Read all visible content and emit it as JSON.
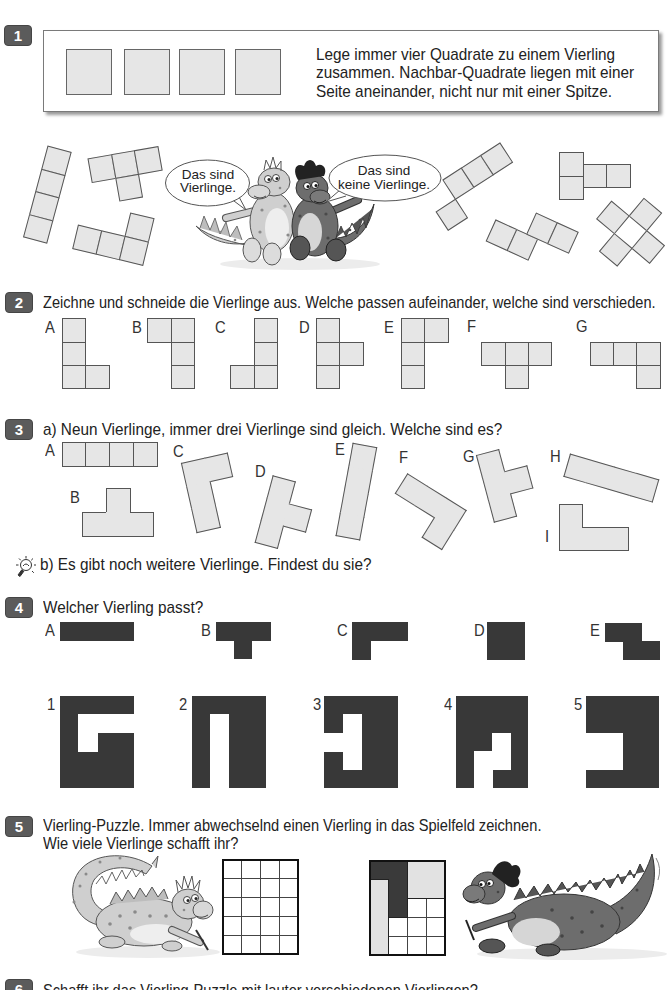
{
  "colors": {
    "badge": "#5b5b5b",
    "tile_fill": "#e6e6e6",
    "tile_stroke": "#555555",
    "dark_fill": "#383838",
    "light_fill": "#e2e2e2"
  },
  "exercise1": {
    "number": "1",
    "instruction_lines": [
      "Lege immer vier Quadrate zu einem Vierling",
      "zusammen. Nachbar-Quadrate liegen mit einer",
      "Seite aneinander, nicht nur mit einer Spitze."
    ],
    "bubble_left": {
      "line1": "Das sind",
      "line2": "Vierlinge."
    },
    "bubble_right": {
      "line1": "Das sind",
      "line2": "keine Vierlinge."
    },
    "valid_examples": [
      {
        "name": "I",
        "cx": 46.5,
        "cy": 194,
        "rot": 15,
        "s": 23.5,
        "style": "grid",
        "cells": [
          [
            0,
            0
          ],
          [
            0,
            1
          ],
          [
            0,
            2
          ],
          [
            0,
            3
          ]
        ]
      },
      {
        "name": "T",
        "cx": 125.8,
        "cy": 175,
        "rot": -10,
        "s": 23.5,
        "style": "grid",
        "cells": [
          [
            0,
            0
          ],
          [
            1,
            0
          ],
          [
            2,
            0
          ],
          [
            1,
            1
          ]
        ]
      },
      {
        "name": "L",
        "cx": 112.7,
        "cy": 233.2,
        "rot": 13.5,
        "s": 24,
        "style": "grid",
        "cells": [
          [
            2,
            0
          ],
          [
            0,
            1
          ],
          [
            1,
            1
          ],
          [
            2,
            1
          ]
        ]
      }
    ],
    "invalid_examples": [
      {
        "name": "corner-touch",
        "cx": 473.6,
        "cy": 187.1,
        "rot": -33,
        "s": 22.7,
        "style": "grid",
        "cells": [
          [
            1,
            0
          ],
          [
            2,
            0
          ],
          [
            3,
            0
          ],
          [
            0,
            1
          ]
        ]
      },
      {
        "name": "half-offset",
        "x": 559,
        "y": 152,
        "rot": 0,
        "s": 23.5,
        "style": "grid",
        "cells": [
          [
            0,
            0
          ],
          [
            0,
            1
          ],
          [
            1,
            0.5
          ],
          [
            2,
            0.5
          ]
        ]
      },
      {
        "name": "shifted-dominoes",
        "cx": 532.1,
        "cy": 236,
        "rot": 24.5,
        "s": 22.9,
        "style": "grid",
        "cells": [
          [
            0,
            1
          ],
          [
            1,
            1
          ],
          [
            1.5,
            0
          ],
          [
            2.5,
            0
          ]
        ]
      },
      {
        "name": "ring",
        "cx": 630,
        "cy": 231,
        "rot": 40,
        "s": 23,
        "style": "grid",
        "cells": [
          [
            1,
            0
          ],
          [
            0,
            1
          ],
          [
            2,
            1
          ],
          [
            1,
            2
          ]
        ]
      }
    ]
  },
  "exercise2": {
    "number": "2",
    "instruction": "Zeichne und schneide die Vierlinge aus. Welche passen aufeinander, welche sind verschieden.",
    "shapes": [
      {
        "label": "A",
        "x": 61.9,
        "y": 318.3,
        "s": 23.4,
        "style": "grid",
        "cells": [
          [
            0,
            0
          ],
          [
            0,
            1
          ],
          [
            0,
            2
          ],
          [
            1,
            2
          ]
        ]
      },
      {
        "label": "B",
        "x": 147.2,
        "y": 318.3,
        "s": 23.4,
        "style": "grid",
        "cells": [
          [
            0,
            0
          ],
          [
            1,
            0
          ],
          [
            1,
            1
          ],
          [
            1,
            2
          ]
        ]
      },
      {
        "label": "C",
        "x": 230.4,
        "y": 318.3,
        "s": 23.4,
        "style": "grid",
        "cells": [
          [
            1,
            0
          ],
          [
            1,
            1
          ],
          [
            0,
            2
          ],
          [
            1,
            2
          ]
        ]
      },
      {
        "label": "D",
        "x": 315.8,
        "y": 318.3,
        "s": 23.4,
        "style": "grid",
        "cells": [
          [
            0,
            0
          ],
          [
            0,
            1
          ],
          [
            1,
            1
          ],
          [
            0,
            2
          ]
        ]
      },
      {
        "label": "E",
        "x": 401.1,
        "y": 318.3,
        "s": 23.4,
        "style": "grid",
        "cells": [
          [
            0,
            0
          ],
          [
            1,
            0
          ],
          [
            0,
            1
          ],
          [
            0,
            2
          ]
        ]
      },
      {
        "label": "F",
        "x": 481.3,
        "y": 318.3,
        "s": 23.4,
        "style": "grid",
        "cells": [
          [
            0,
            1
          ],
          [
            1,
            1
          ],
          [
            2,
            1
          ],
          [
            1,
            2
          ]
        ]
      },
      {
        "label": "G",
        "x": 589.7,
        "y": 318.3,
        "s": 23.4,
        "style": "grid",
        "cells": [
          [
            0,
            1
          ],
          [
            1,
            1
          ],
          [
            2,
            1
          ],
          [
            2,
            2
          ]
        ]
      }
    ]
  },
  "exercise3": {
    "number": "3",
    "part_a": "a) Neun Vierlinge, immer drei Vierlinge sind gleich. Welche sind es?",
    "part_b": "b) Es gibt noch weitere Vierlinge. Findest du sie?",
    "hint_icon": "lightbulb-icon",
    "shapes": [
      {
        "label": "A",
        "x": 61.7,
        "y": 442.3,
        "s": 23.75,
        "style": "grid",
        "cells": [
          [
            0,
            0
          ],
          [
            1,
            0
          ],
          [
            2,
            0
          ],
          [
            3,
            0
          ]
        ]
      },
      {
        "label": "B",
        "x": 82.4,
        "y": 488.3,
        "s": 23.7,
        "style": "outline",
        "cells": [
          [
            1,
            0
          ],
          [
            0,
            1
          ],
          [
            1,
            1
          ],
          [
            2,
            1
          ]
        ]
      },
      {
        "label": "C",
        "cx": 211.4,
        "cy": 492.7,
        "rot": -12.6,
        "s": 23.5,
        "style": "outline",
        "cells": [
          [
            0,
            0
          ],
          [
            1,
            0
          ],
          [
            0,
            1
          ],
          [
            0,
            2
          ]
        ]
      },
      {
        "label": "D",
        "cx": 286.4,
        "cy": 514.3,
        "rot": 15,
        "s": 23,
        "style": "outline",
        "cells": [
          [
            0,
            0
          ],
          [
            0,
            1
          ],
          [
            1,
            1
          ],
          [
            0,
            2
          ]
        ]
      },
      {
        "label": "E",
        "cx": 356.2,
        "cy": 490.5,
        "rot": 10.4,
        "s": 23.5,
        "style": "outline",
        "cells": [
          [
            0,
            0
          ],
          [
            0,
            1
          ],
          [
            0,
            2
          ],
          [
            0,
            3
          ]
        ]
      },
      {
        "label": "F",
        "cx": 424.6,
        "cy": 511.1,
        "rot": 32,
        "s": 23,
        "style": "outline",
        "cells": [
          [
            0,
            0
          ],
          [
            1,
            0
          ],
          [
            2,
            0
          ],
          [
            2,
            1
          ]
        ]
      },
      {
        "label": "G",
        "cx": 506.9,
        "cy": 482.3,
        "rot": -15,
        "s": 23,
        "style": "outline",
        "cells": [
          [
            0,
            0
          ],
          [
            0,
            1
          ],
          [
            1,
            1
          ],
          [
            0,
            2
          ]
        ]
      },
      {
        "label": "H",
        "cx": 611.4,
        "cy": 477.3,
        "rot": 16.2,
        "s": 23,
        "style": "outline",
        "cells": [
          [
            0,
            0
          ],
          [
            1,
            0
          ],
          [
            2,
            0
          ],
          [
            3,
            0
          ]
        ]
      },
      {
        "label": "I",
        "x": 559,
        "y": 504,
        "s": 23,
        "style": "outline",
        "cells": [
          [
            0,
            0
          ],
          [
            0,
            1
          ],
          [
            1,
            1
          ],
          [
            2,
            1
          ]
        ]
      }
    ]
  },
  "exercise4": {
    "number": "4",
    "instruction": "Welcher Vierling passt?",
    "pieces": [
      {
        "label": "A",
        "x": 60,
        "y": 622.3,
        "s": 18.3,
        "style": "dark",
        "cells": [
          [
            0,
            0
          ],
          [
            1,
            0
          ],
          [
            2,
            0
          ],
          [
            3,
            0
          ]
        ]
      },
      {
        "label": "B",
        "x": 215.5,
        "y": 622.3,
        "s": 18.2,
        "style": "dark",
        "cells": [
          [
            0,
            0
          ],
          [
            1,
            0
          ],
          [
            2,
            0
          ],
          [
            1,
            1
          ]
        ]
      },
      {
        "label": "C",
        "x": 352,
        "y": 622.3,
        "s": 18.5,
        "style": "dark",
        "cells": [
          [
            0,
            0
          ],
          [
            1,
            0
          ],
          [
            2,
            0
          ],
          [
            0,
            1
          ]
        ]
      },
      {
        "label": "D",
        "x": 487.3,
        "y": 622.3,
        "s": 18.5,
        "style": "dark",
        "cells": [
          [
            0,
            0
          ],
          [
            1,
            0
          ],
          [
            0,
            1
          ],
          [
            1,
            1
          ]
        ]
      },
      {
        "label": "E",
        "x": 605,
        "y": 623,
        "s": 18.2,
        "style": "dark",
        "cells": [
          [
            0,
            0
          ],
          [
            1,
            0
          ],
          [
            1,
            1
          ],
          [
            2,
            1
          ]
        ]
      }
    ],
    "frames": [
      {
        "label": "1",
        "x": 59.7,
        "y": 695.7,
        "cols": 4,
        "rows": 5,
        "cw": 18.7,
        "ch": 18.5,
        "hole": [
          [
            1,
            1
          ],
          [
            2,
            1
          ],
          [
            3,
            1
          ],
          [
            1,
            2
          ]
        ]
      },
      {
        "label": "2",
        "x": 192,
        "y": 695.7,
        "cols": 4,
        "rows": 5,
        "cw": 18.4,
        "ch": 18.5,
        "hole": [
          [
            1,
            1
          ],
          [
            1,
            2
          ],
          [
            1,
            3
          ],
          [
            1,
            4
          ]
        ]
      },
      {
        "label": "3",
        "x": 324.3,
        "y": 695.7,
        "cols": 4,
        "rows": 5,
        "cw": 18.5,
        "ch": 18.5,
        "hole": [
          [
            1,
            1
          ],
          [
            1,
            2
          ],
          [
            1,
            3
          ],
          [
            0,
            2
          ]
        ]
      },
      {
        "label": "4",
        "x": 455.7,
        "y": 695.7,
        "cols": 4,
        "rows": 5,
        "cw": 18.2,
        "ch": 18.5,
        "hole": [
          [
            2,
            2
          ],
          [
            2,
            3
          ],
          [
            1,
            3
          ],
          [
            1,
            4
          ]
        ]
      },
      {
        "label": "5",
        "x": 585.9,
        "y": 695.7,
        "cols": 4,
        "rows": 5,
        "cw": 18.3,
        "ch": 18.5,
        "hole": [
          [
            0,
            2
          ],
          [
            1,
            2
          ],
          [
            0,
            3
          ],
          [
            1,
            3
          ]
        ]
      }
    ]
  },
  "exercise5": {
    "number": "5",
    "instruction_lines": [
      "Vierling-Puzzle. Immer abwechselnd einen Vierling in das Spielfeld zeichnen.",
      "Wie viele Vierlinge schafft ihr?"
    ],
    "grids": [
      {
        "name": "empty-board",
        "x": 222,
        "y": 859,
        "cols": 4,
        "rows": 5,
        "cs": 19,
        "pieces": []
      },
      {
        "name": "example-board",
        "x": 369,
        "y": 860,
        "cols": 4,
        "rows": 5,
        "cs": 19,
        "pieces": [
          {
            "color": "#3a3a3a",
            "cells": [
              [
                0,
                0
              ],
              [
                1,
                0
              ],
              [
                1,
                1
              ],
              [
                1,
                2
              ]
            ]
          },
          {
            "color": "#e2e2e2",
            "cells": [
              [
                0,
                1
              ],
              [
                0,
                2
              ],
              [
                0,
                3
              ],
              [
                0,
                4
              ]
            ]
          },
          {
            "color": "#e2e2e2",
            "cells": [
              [
                2,
                0
              ],
              [
                3,
                0
              ],
              [
                2,
                1
              ],
              [
                3,
                1
              ]
            ]
          }
        ]
      }
    ]
  },
  "exercise6": {
    "number": "6",
    "instruction": "Schafft ihr das Vierling-Puzzle mit lauter verschiedenen Vierlingen?"
  }
}
